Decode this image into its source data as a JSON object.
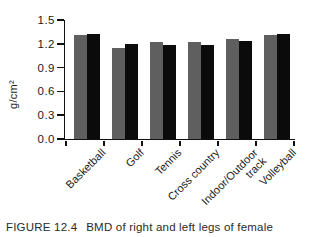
{
  "figure": {
    "caption_label": "FIGURE 12.4",
    "caption_text": "BMD of right and left legs of female"
  },
  "colors": {
    "right_leg_bar": "#5f5f5f",
    "left_leg_bar": "#0b0b0b",
    "axis": "#111111",
    "background": "#ffffff"
  },
  "chart_data": {
    "type": "bar",
    "title": "",
    "xlabel": "",
    "ylabel": "g/cm²",
    "ylim": [
      0,
      1.5
    ],
    "ytick_step": 0.3,
    "yticks": [
      "1.5",
      "1.2",
      "0.9",
      "0.6",
      "0.3",
      "0.0"
    ],
    "grid": false,
    "legend": "none",
    "categories": [
      "Basketball",
      "Golf",
      "Tennis",
      "Cross country",
      "Indoor/Outdoor\ntrack",
      "Volleyball"
    ],
    "series": [
      {
        "name": "right leg",
        "color": "#5f5f5f",
        "values": [
          1.31,
          1.15,
          1.22,
          1.22,
          1.26,
          1.31
        ]
      },
      {
        "name": "left leg",
        "color": "#0b0b0b",
        "values": [
          1.33,
          1.2,
          1.18,
          1.19,
          1.23,
          1.33
        ]
      }
    ]
  }
}
